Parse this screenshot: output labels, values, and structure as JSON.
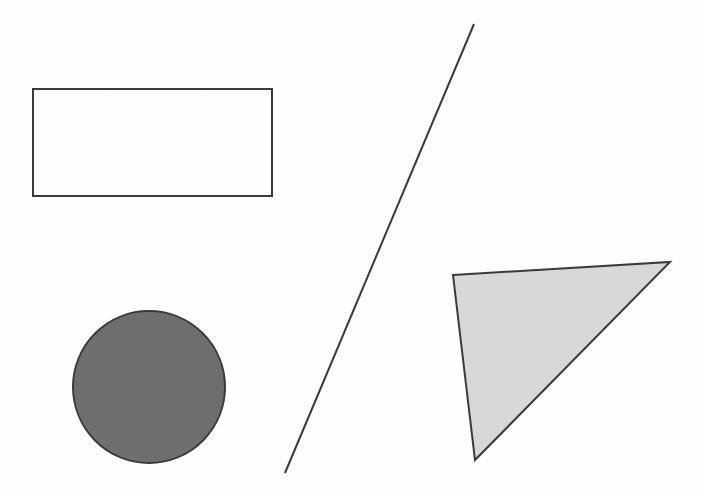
{
  "canvas": {
    "width": 704,
    "height": 496,
    "background_color": "#fdfdfd",
    "description": "Scanned black-and-white figure containing four simple geometric shapes"
  },
  "palette": {
    "stroke_color": "#3a3a3a",
    "circle_fill": "#6e6e6e",
    "triangle_fill": "#d8d8d8",
    "rectangle_fill": "none",
    "background": "#fdfdfd"
  },
  "shapes": [
    {
      "id": "rectangle",
      "name": "rectangle",
      "label": "Rectangle",
      "fill": "none",
      "stroke": "#3a3a3a",
      "stroke_width": 2,
      "x": 33,
      "y": 89,
      "width": 239,
      "height": 107
    },
    {
      "id": "circle",
      "name": "circle",
      "label": "Circle",
      "fill": "#6e6e6e",
      "stroke": "#3a3a3a",
      "stroke_width": 2,
      "cx": 149,
      "cy": 387,
      "r": 76
    },
    {
      "id": "line",
      "name": "diagonal-line",
      "label": "Diagonal line",
      "fill": "none",
      "stroke": "#3a3a3a",
      "stroke_width": 2,
      "x1": 474,
      "y1": 24,
      "x2": 285,
      "y2": 473
    },
    {
      "id": "triangle",
      "name": "triangle",
      "label": "Triangle",
      "fill": "#d8d8d8",
      "stroke": "#3a3a3a",
      "stroke_width": 2,
      "points": "453,275 670,262 475,460"
    }
  ]
}
